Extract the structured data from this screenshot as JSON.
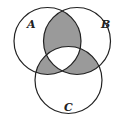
{
  "diagram": {
    "type": "venn",
    "sets": [
      {
        "label": "A",
        "cx": 47.5,
        "cy": 41,
        "r": 33.5
      },
      {
        "label": "B",
        "cx": 77,
        "cy": 41,
        "r": 33.5
      },
      {
        "label": "C",
        "cx": 68.5,
        "cy": 80,
        "r": 33.5
      }
    ],
    "shaded_regions": [
      "A∩B only",
      "A∩C only",
      "B∩C only"
    ],
    "colors": {
      "shade": "#9a9a9a",
      "stroke": "#222222",
      "background": "#ffffff"
    }
  }
}
